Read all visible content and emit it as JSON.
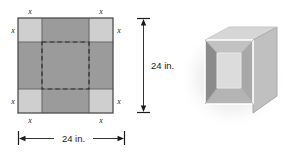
{
  "figure": {
    "name": "open-box-construction-figure",
    "flat_sheet": {
      "name": "cardboard-sheet-diagram",
      "width_label": "24 in.",
      "height_label": "24 in.",
      "corner_labels": [
        "x",
        "x",
        "x",
        "x",
        "x",
        "x",
        "x",
        "x"
      ],
      "corner_top_left": "x",
      "corner_top_left_side": "x",
      "corner_top_right": "x",
      "corner_top_right_side": "x",
      "corner_bottom_left": "x",
      "corner_bottom_left_side": "x",
      "corner_bottom_right": "x",
      "corner_bottom_right_side": "x",
      "colors": {
        "sheet_dark": "#9b9b9b",
        "corner_light": "#cfcfcf",
        "outline": "#4d4d4d",
        "fold_dashed": "#2b2b2b",
        "dimension_line": "#1a1a1a"
      }
    },
    "box_3d": {
      "name": "folded-open-box",
      "colors": {
        "outer_right_face": "#c4c4c4",
        "outer_top_rim": "#d8d8d8",
        "inner_left_wall": "#8f8f8f",
        "inner_back_wall": "#b0b0b0",
        "inner_front_wall": "#a0a0a0",
        "inner_bottom": "#dedede",
        "edge_highlight": "#ffffff",
        "shadow": "#e8e8e8"
      }
    }
  }
}
